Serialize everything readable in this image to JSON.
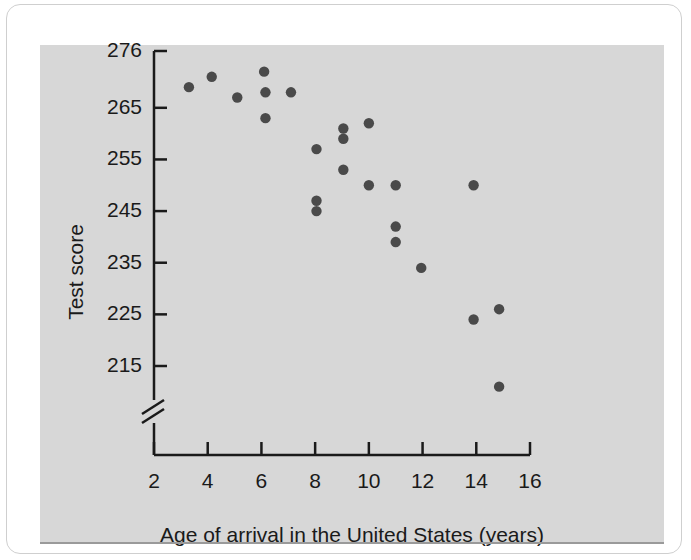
{
  "figure": {
    "panel_background": "#d7d7d7",
    "card_background": "#ffffff",
    "marker_color": "#4a4a4a",
    "axis_color": "#1a1a1a"
  },
  "chart_data": {
    "type": "scatter",
    "title": "",
    "xlabel": "Age of arrival in the United States (years)",
    "ylabel": "Test score",
    "xlim": [
      2,
      16
    ],
    "ylim": [
      210,
      276
    ],
    "grid": false,
    "legend": null,
    "y_axis_break": true,
    "y_axis_break_note": "zig-zag break below 215",
    "xticks": [
      2,
      4,
      6,
      8,
      10,
      12,
      14,
      16
    ],
    "xtick_labels": [
      "2",
      "4",
      "6",
      "8",
      "10",
      "12",
      "14",
      "16"
    ],
    "yticks": [
      215,
      225,
      235,
      245,
      255,
      265,
      276
    ],
    "ytick_labels": [
      "215",
      "225",
      "235",
      "245",
      "255",
      "265",
      "276"
    ],
    "points": [
      {
        "x": 3.3,
        "y": 269
      },
      {
        "x": 4.15,
        "y": 271
      },
      {
        "x": 5.1,
        "y": 267
      },
      {
        "x": 6.1,
        "y": 272
      },
      {
        "x": 6.15,
        "y": 268
      },
      {
        "x": 6.15,
        "y": 263
      },
      {
        "x": 7.1,
        "y": 268
      },
      {
        "x": 8.05,
        "y": 257
      },
      {
        "x": 9.05,
        "y": 261
      },
      {
        "x": 9.05,
        "y": 259
      },
      {
        "x": 9.05,
        "y": 253
      },
      {
        "x": 8.05,
        "y": 247
      },
      {
        "x": 8.05,
        "y": 245
      },
      {
        "x": 10.0,
        "y": 262
      },
      {
        "x": 10.0,
        "y": 250
      },
      {
        "x": 11.0,
        "y": 250
      },
      {
        "x": 11.0,
        "y": 242
      },
      {
        "x": 11.0,
        "y": 239
      },
      {
        "x": 11.95,
        "y": 234
      },
      {
        "x": 13.9,
        "y": 250
      },
      {
        "x": 13.9,
        "y": 224
      },
      {
        "x": 14.85,
        "y": 226
      },
      {
        "x": 14.85,
        "y": 211
      }
    ]
  }
}
